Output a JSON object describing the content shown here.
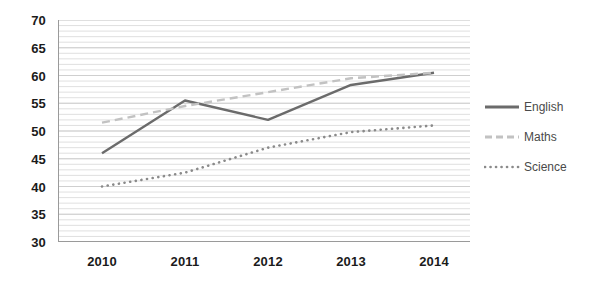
{
  "chart_data": {
    "type": "line",
    "title": "",
    "xlabel": "",
    "ylabel": "",
    "categories": [
      "2010",
      "2011",
      "2012",
      "2013",
      "2014"
    ],
    "xticklabels": [
      "2010",
      "2011",
      "2012",
      "2013",
      "2014"
    ],
    "yticklabels": [
      "70",
      "65",
      "60",
      "55",
      "50",
      "45",
      "40",
      "35",
      "30"
    ],
    "ylim": [
      30,
      70
    ],
    "ytick_step": 5,
    "minor_gridlines": true,
    "minor_gridline_step": 1,
    "grid": "horizontal",
    "legend_position": "right",
    "series": [
      {
        "name": "English",
        "style": "solid",
        "color": "#6b6b6b",
        "values": [
          46,
          55.5,
          52,
          58.3,
          60.5
        ]
      },
      {
        "name": "Maths",
        "style": "dashed",
        "color": "#c2c2c2",
        "values": [
          51.5,
          54.5,
          57,
          59.5,
          60.5
        ]
      },
      {
        "name": "Science",
        "style": "dotted",
        "color": "#8a8a8a",
        "values": [
          40,
          42.5,
          47,
          49.8,
          51
        ]
      }
    ]
  },
  "legend": {
    "items": [
      {
        "label": "English"
      },
      {
        "label": "Maths"
      },
      {
        "label": "Science"
      }
    ]
  },
  "colors": {
    "english": "#6b6b6b",
    "maths": "#c2c2c2",
    "science": "#8a8a8a",
    "axis": "#9a9a9a",
    "gridline": "#d8d8d8",
    "tick_text": "#1b1b1b",
    "legend_text": "#4a4a4a",
    "background": "#ffffff"
  }
}
